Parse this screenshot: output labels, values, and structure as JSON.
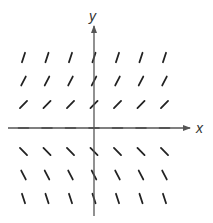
{
  "figure": {
    "type": "slope_field",
    "axes": {
      "x_label": "x",
      "y_label": "y",
      "color": "#555555",
      "origin_px": [
        94,
        128
      ],
      "x_axis": {
        "from_px": 8,
        "to_px": 190
      },
      "y_axis": {
        "from_px": 26,
        "to_px": 216
      }
    },
    "grid": {
      "x_values": [
        -3,
        -2,
        -1,
        0,
        1,
        2,
        3
      ],
      "y_values": [
        3,
        2,
        1,
        0,
        -1,
        -2,
        -3
      ],
      "spacing_px": 23.5,
      "segment_color": "#222222"
    },
    "slopes_by_row": [
      {
        "y": 3,
        "angle_deg": 72
      },
      {
        "y": 2,
        "angle_deg": 63
      },
      {
        "y": 1,
        "angle_deg": 45
      },
      {
        "y": 0,
        "angle_deg": 0
      },
      {
        "y": -1,
        "angle_deg": -45
      },
      {
        "y": -2,
        "angle_deg": -63
      },
      {
        "y": -3,
        "angle_deg": -72
      }
    ]
  }
}
